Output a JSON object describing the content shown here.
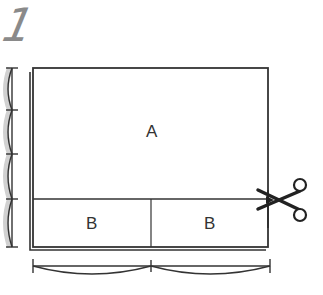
{
  "diagram": {
    "step_number": "1",
    "regions": {
      "top": {
        "label": "A"
      },
      "bottom_left": {
        "label": "B"
      },
      "bottom_right": {
        "label": "B"
      }
    },
    "icons": {
      "scissors": "scissors-icon"
    },
    "measurements": {
      "vertical_divisions": 4,
      "horizontal_divisions": 2
    },
    "colors": {
      "line": "#333333",
      "step_number": "#8a8a8a",
      "shading": "#9a9a9a",
      "background": "#ffffff"
    }
  }
}
